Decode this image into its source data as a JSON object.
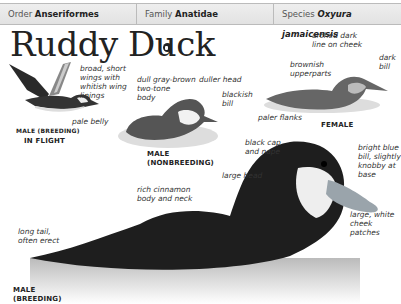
{
  "header": {
    "order": {
      "label": "Order",
      "value": "Anseriformes"
    },
    "family": {
      "label": "Family",
      "value": "Anatidae"
    },
    "species": {
      "label": "Species",
      "value": "Oxyura jamaicensis"
    }
  },
  "title": "Ruddy Duck",
  "sound_icon": "speaker-icon",
  "figures": {
    "flight": {
      "caption_line1": "MALE (BREEDING)",
      "caption_line2": "IN FLIGHT",
      "labels": [
        "broad, short\nwings with\nwhitish wing\nlinings",
        "pale belly"
      ]
    },
    "nonbreeding": {
      "caption": "MALE\n(NONBREEDING)",
      "labels": [
        "dull gray-brown\ntwo-tone\nbody",
        "duller head",
        "blackish\nbill"
      ]
    },
    "female": {
      "caption": "FEMALE",
      "labels": [
        "arched dark\nline on cheek",
        "dark\nbill",
        "brownish\nupperparts",
        "paler flanks"
      ]
    },
    "breeding": {
      "caption": "MALE\n(BREEDING)",
      "labels": [
        "black cap\nand nape",
        "bright blue\nbill, slightly\nknobby at\nbase",
        "large head",
        "large, white\ncheek\npatches",
        "rich cinnamon\nbody and neck",
        "long tail,\noften erect"
      ]
    }
  }
}
